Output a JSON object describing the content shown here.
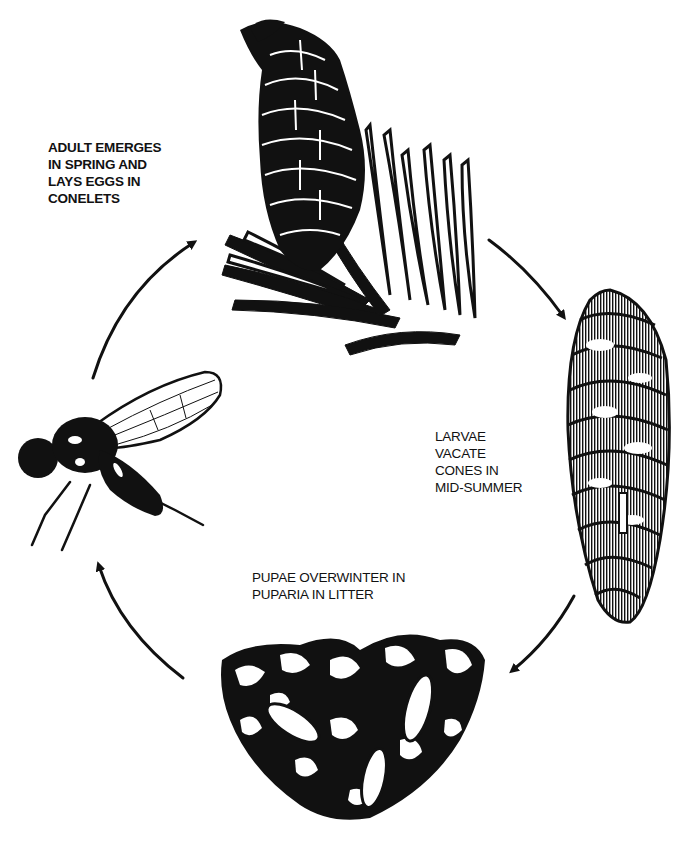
{
  "diagram": {
    "type": "life-cycle",
    "colors": {
      "ink": "#111111",
      "background": "#ffffff"
    },
    "stages": [
      {
        "id": "adult",
        "label": "ADULT EMERGES\nIN SPRING AND\nLAYS EGGS IN\nCONELETS",
        "illustration": "conelet-on-branch"
      },
      {
        "id": "larvae",
        "label": "LARVAE\nVACATE\nCONES IN\nMID-SUMMER",
        "illustration": "mature-cone"
      },
      {
        "id": "pupae",
        "label": "PUPAE OVERWINTER IN\nPUPARIA IN LITTER",
        "illustration": "puparia-in-litter"
      },
      {
        "id": "fly",
        "label": "",
        "illustration": "adult-fly"
      }
    ],
    "arrows": [
      {
        "from": "fly",
        "to": "conelet",
        "direction": "clockwise"
      },
      {
        "from": "conelet",
        "to": "cone",
        "direction": "clockwise"
      },
      {
        "from": "cone",
        "to": "litter",
        "direction": "clockwise"
      },
      {
        "from": "litter",
        "to": "fly",
        "direction": "clockwise"
      }
    ]
  }
}
